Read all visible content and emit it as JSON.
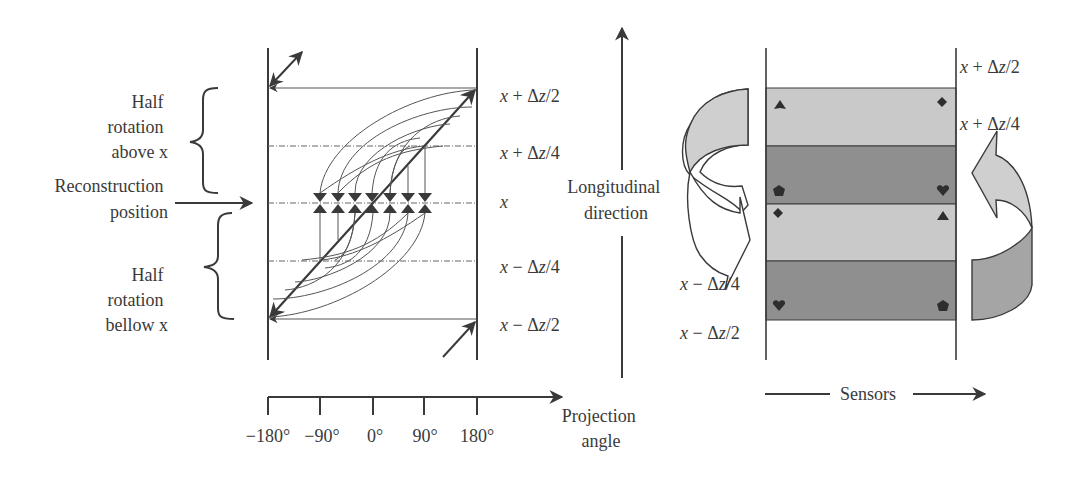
{
  "left_panel": {
    "labels": {
      "half_above": [
        "Half",
        "rotation",
        "above x"
      ],
      "reconstruction": [
        "Reconstruction",
        "position"
      ],
      "half_below": [
        "Half",
        "rotation",
        "bellow  x"
      ]
    },
    "levels": [
      {
        "var": "x",
        "op": " + ",
        "delta": "Δ",
        "z": "z",
        "frac": "/2"
      },
      {
        "var": "x",
        "op": " + ",
        "delta": "Δ",
        "z": "z",
        "frac": "/4"
      },
      {
        "var": "x",
        "op": "",
        "delta": "",
        "z": "",
        "frac": ""
      },
      {
        "var": "x",
        "op": " − ",
        "delta": "Δ",
        "z": "z",
        "frac": "/4"
      },
      {
        "var": "x",
        "op": " − ",
        "delta": "Δ",
        "z": "z",
        "frac": "/2"
      }
    ],
    "axis": {
      "ticks": [
        "−180°",
        "−90°",
        "0°",
        "90°",
        "180°"
      ],
      "label": [
        "Projection",
        "angle"
      ]
    }
  },
  "center": {
    "label": [
      "Longitudinal",
      "direction"
    ]
  },
  "right_panel": {
    "levels_right": [
      {
        "var": "x",
        "op": " + ",
        "delta": "Δ",
        "z": "z",
        "frac": "/2"
      },
      {
        "var": "x",
        "op": " + ",
        "delta": "Δ",
        "z": "z",
        "frac": "/4"
      }
    ],
    "levels_left": [
      {
        "var": "x",
        "op": " − ",
        "delta": "Δ",
        "z": "z",
        "frac": "/4"
      },
      {
        "var": "x",
        "op": " − ",
        "delta": "Δ",
        "z": "z",
        "frac": "/2"
      }
    ],
    "sensors_label": "Sensors",
    "colors": {
      "light_band": "#c9c9c9",
      "dark_band": "#8f8f8f",
      "left_arrow_fill": "#cfcfcf",
      "right_arrow_fill_top": "#cfcfcf",
      "right_arrow_fill_bottom": "#a5a5a5"
    },
    "markers": [
      {
        "band": 1,
        "left": "triangle",
        "right": "diamond"
      },
      {
        "band": 2,
        "left": "pentagon",
        "right": "heart"
      },
      {
        "band": 3,
        "left": "diamond",
        "right": "triangle"
      },
      {
        "band": 4,
        "left": "heart",
        "right": "pentagon"
      }
    ]
  }
}
